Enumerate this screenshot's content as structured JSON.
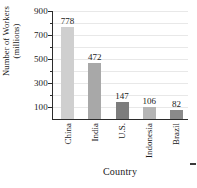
{
  "chart_data": {
    "type": "bar",
    "title": "",
    "xlabel": "Country",
    "ylabel_line1": "Number of Workers",
    "ylabel_line2": "(millions)",
    "categories": [
      "China",
      "India",
      "U.S.",
      "Indonesia",
      "Brazil"
    ],
    "values": [
      778,
      472,
      147,
      106,
      82
    ],
    "bar_colors": [
      "#cfcfcf",
      "#a8a8a8",
      "#7d7d7d",
      "#b5b5b5",
      "#8a8a8a"
    ],
    "ylim": [
      0,
      900
    ],
    "ytick_major": [
      900,
      700,
      500,
      300,
      100
    ],
    "ytick_minor": [
      800,
      600,
      400,
      200
    ],
    "grid": true,
    "legend": "none"
  },
  "axis": {
    "major_tick_labels": [
      "900",
      "700",
      "500",
      "300",
      "100"
    ]
  }
}
